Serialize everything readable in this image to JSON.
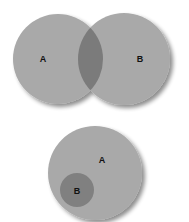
{
  "diagrams": [
    {
      "type": "venn-overlap",
      "sets": [
        {
          "label": "A",
          "cx": 58,
          "cy": 59,
          "r": 45
        },
        {
          "label": "B",
          "cx": 124,
          "cy": 59,
          "r": 46
        }
      ],
      "label_positions": [
        {
          "x": 43,
          "y": 62
        },
        {
          "x": 140,
          "y": 62
        }
      ]
    },
    {
      "type": "venn-subset",
      "sets": [
        {
          "label": "A",
          "cx": 95,
          "cy": 173,
          "r": 47
        },
        {
          "label": "B",
          "cx": 77,
          "cy": 190,
          "r": 17
        }
      ],
      "label_positions": [
        {
          "x": 102,
          "y": 163
        },
        {
          "x": 77,
          "y": 194
        }
      ]
    }
  ],
  "colors": {
    "set_fill": "#a9a9a9",
    "intersection_fill": "#7b7b7b",
    "subset_fill": "#808080",
    "shadow": "#6e6e6e",
    "label": "#111111"
  }
}
